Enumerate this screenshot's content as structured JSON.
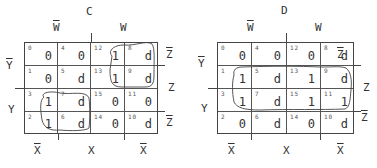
{
  "maps": [
    {
      "title": "C",
      "col_labels_top": [
        "W",
        "W"
      ],
      "col_labels_top_overline": [
        true,
        false
      ],
      "col_labels_bottom": [
        "X",
        "X",
        "X"
      ],
      "col_labels_bottom_overline": [
        true,
        false,
        true
      ],
      "row_labels_left": [
        "Y",
        "Y"
      ],
      "row_labels_left_overline": [
        true,
        false
      ],
      "row_labels_right": [
        "Z",
        "Z",
        "Z"
      ],
      "row_labels_right_overline": [
        true,
        false,
        true
      ],
      "cells": [
        [
          {
            "index": "0",
            "value": "0"
          },
          {
            "index": "4",
            "value": "0"
          },
          {
            "index": "12",
            "value": "1"
          },
          {
            "index": "8",
            "value": "d"
          }
        ],
        [
          {
            "index": "1",
            "value": "0"
          },
          {
            "index": "5",
            "value": "d"
          },
          {
            "index": "13",
            "value": "1"
          },
          {
            "index": "9",
            "value": "d"
          }
        ],
        [
          {
            "index": "3",
            "value": "1"
          },
          {
            "index": "7",
            "value": "d"
          },
          {
            "index": "15",
            "value": "0"
          },
          {
            "index": "11",
            "value": "0"
          }
        ],
        [
          {
            "index": "2",
            "value": "1"
          },
          {
            "index": "6",
            "value": "d"
          },
          {
            "index": "14",
            "value": "0"
          },
          {
            "index": "10",
            "value": "d"
          }
        ]
      ],
      "groupings": [
        "cells 12,8,13,9",
        "cells 3,7,2,6"
      ]
    },
    {
      "title": "D",
      "col_labels_top": [
        "W",
        "W"
      ],
      "col_labels_top_overline": [
        true,
        false
      ],
      "col_labels_bottom": [
        "X",
        "X",
        "X"
      ],
      "col_labels_bottom_overline": [
        true,
        false,
        true
      ],
      "row_labels_left": [
        "Y",
        "Y"
      ],
      "row_labels_left_overline": [
        true,
        false
      ],
      "row_labels_right": [
        "Z",
        "Z",
        "Z"
      ],
      "row_labels_right_overline": [
        true,
        false,
        true
      ],
      "cells": [
        [
          {
            "index": "0",
            "value": "0"
          },
          {
            "index": "4",
            "value": "0"
          },
          {
            "index": "12",
            "value": "0"
          },
          {
            "index": "8",
            "value": "d"
          }
        ],
        [
          {
            "index": "1",
            "value": "1"
          },
          {
            "index": "5",
            "value": "d"
          },
          {
            "index": "13",
            "value": "1"
          },
          {
            "index": "9",
            "value": "d"
          }
        ],
        [
          {
            "index": "3",
            "value": "1"
          },
          {
            "index": "7",
            "value": "d"
          },
          {
            "index": "15",
            "value": "1"
          },
          {
            "index": "11",
            "value": "1"
          }
        ],
        [
          {
            "index": "2",
            "value": "0"
          },
          {
            "index": "6",
            "value": "d"
          },
          {
            "index": "14",
            "value": "0"
          },
          {
            "index": "10",
            "value": "d"
          }
        ]
      ],
      "groupings": [
        "cells 1,5,13,9,3,7,15,11"
      ]
    }
  ]
}
